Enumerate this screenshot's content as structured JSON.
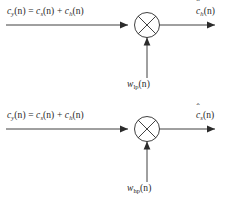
{
  "figure": {
    "type": "signal-flow-block-diagram",
    "background_color": "#ffffff",
    "line_color": "#2b2b2b",
    "diagram_count": 2
  },
  "diagrams": [
    {
      "id": "lowpass-modulator",
      "name": "lowpass-branch",
      "input": {
        "signal": "c",
        "signal_subscript": "y",
        "argument": "(n)",
        "equals": "=",
        "term1_signal": "c",
        "term1_subscript": "s",
        "term1_argument": "(n)",
        "plus": "+",
        "term2_signal": "c",
        "term2_subscript": "h",
        "term2_argument": "(n)",
        "full_text": "c_y(n) = c_s(n) + c_h(n)"
      },
      "operator": {
        "symbol": "multiplier",
        "glyph": "circle-with-cross"
      },
      "carrier": {
        "signal": "w",
        "subscript": "lp",
        "argument": "(n)",
        "full_text": "w_lp(n)"
      },
      "output": {
        "signal": "c",
        "accent": "hat",
        "subscript": "h",
        "argument": "(n)",
        "full_text": "ĉ_h(n)"
      }
    },
    {
      "id": "highpass-modulator",
      "name": "highpass-branch",
      "input": {
        "signal": "c",
        "signal_subscript": "y",
        "argument": "(n)",
        "equals": "=",
        "term1_signal": "c",
        "term1_subscript": "s",
        "term1_argument": "(n)",
        "plus": "+",
        "term2_signal": "c",
        "term2_subscript": "h",
        "term2_argument": "(n)",
        "full_text": "c_y(n) = c_s(n) + c_h(n)"
      },
      "operator": {
        "symbol": "multiplier",
        "glyph": "circle-with-cross"
      },
      "carrier": {
        "signal": "w",
        "subscript": "hp",
        "argument": "(n)",
        "full_text": "w_hp(n)"
      },
      "output": {
        "signal": "c",
        "accent": "hat",
        "subscript": "s",
        "argument": "(n)",
        "full_text": "ĉ_s(n)"
      }
    }
  ],
  "glyphs": {
    "hat": "ˆ",
    "paren_open": "(",
    "paren_close": ")",
    "n": "n"
  },
  "edge_caption": {
    "line1": "",
    "line2": "",
    "line3": ""
  }
}
